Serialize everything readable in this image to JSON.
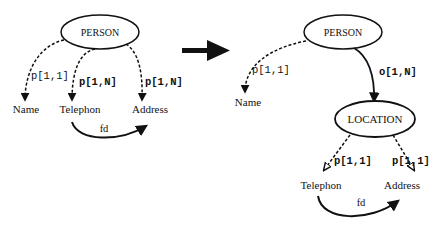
{
  "left_diagram": {
    "root": "PERSON",
    "leaves": {
      "name": "Name",
      "telephon": "Telephon",
      "address": "Address"
    },
    "edges": {
      "name": "p[1,1]",
      "telephon": "p[1,N]",
      "address": "p[1,N]"
    },
    "fd_label": "fd"
  },
  "transform_arrow": "right-arrow",
  "right_diagram": {
    "root": "PERSON",
    "intermediate": "LOCATION",
    "leaves": {
      "name": "Name",
      "telephon": "Telephon",
      "address": "Address"
    },
    "edges": {
      "name": "p[1,1]",
      "location": "o[1,N]",
      "telephon": "p[1,1]",
      "address": "p[1,1]"
    },
    "fd_label": "fd"
  }
}
